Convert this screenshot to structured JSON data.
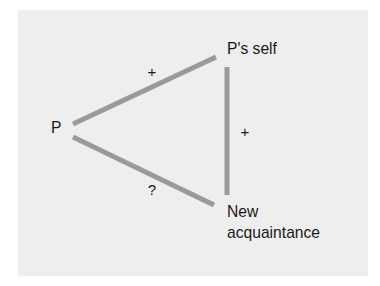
{
  "diagram": {
    "type": "balance-triangle",
    "colors": {
      "background": "#ffffff",
      "panel": "#eeeeee",
      "edge": "#9a9a9a",
      "text": "#1a1a1a"
    },
    "nodes": {
      "p": {
        "label": "P"
      },
      "self": {
        "label": "P's self"
      },
      "acquaintance": {
        "line1": "New",
        "line2": "acquaintance"
      }
    },
    "edges": {
      "p_to_self": {
        "sign": "+"
      },
      "self_to_acquaintance": {
        "sign": "+"
      },
      "p_to_acquaintance": {
        "sign": "?"
      }
    }
  }
}
